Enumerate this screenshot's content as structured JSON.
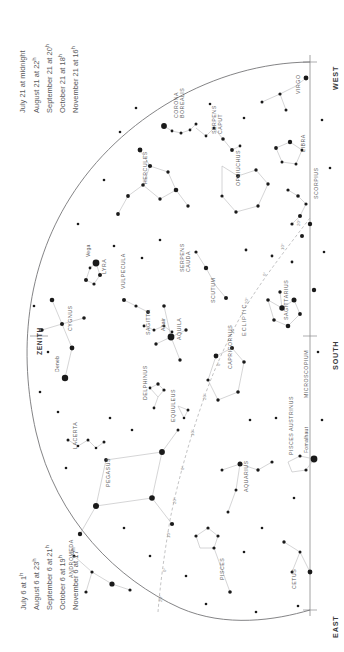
{
  "chart_data": {
    "type": "scatter",
    "xlabel": "",
    "ylabel": "",
    "grid": false,
    "legend_position": "left",
    "projection": "horizon arc with meridian line",
    "axis_note": "Vertical line at right is the horizon/meridian axis marked WEST (top), SOUTH (middle), EAST (bottom)",
    "cardinals": [
      "WEST",
      "SOUTH",
      "EAST"
    ],
    "zenith_label": "ZENITH",
    "ecliptic_label": "ECLIPTIC",
    "ecliptic_ticks": [
      "20°",
      "10°",
      "0°",
      "20°",
      "10°",
      "0°",
      "20°",
      "10°",
      "0°",
      "20°",
      "10°",
      "0°",
      "20°",
      "10°",
      "0°",
      "20°",
      "10°"
    ],
    "named_stars": [
      {
        "name": "Vega",
        "x": 96,
        "y": 263,
        "mag": 0.0
      },
      {
        "name": "Deneb",
        "x": 65,
        "y": 378,
        "mag": 1.3
      },
      {
        "name": "Altair",
        "x": 171,
        "y": 337,
        "mag": 0.8
      },
      {
        "name": "Fomalhaut",
        "x": 314,
        "y": 459,
        "mag": 1.2
      }
    ],
    "constellations": [
      {
        "name": "CORONA BOREALIS",
        "x": 178,
        "y": 118,
        "rot": -90,
        "two_line": true
      },
      {
        "name": "SERPENS CAPUT",
        "x": 216,
        "y": 134,
        "rot": -90,
        "two_line": true
      },
      {
        "name": "HERCULES",
        "x": 147,
        "y": 184,
        "rot": -90
      },
      {
        "name": "OPHIUCHUS",
        "x": 240,
        "y": 186,
        "rot": -90
      },
      {
        "name": "VIRGO",
        "x": 300,
        "y": 94,
        "rot": -90
      },
      {
        "name": "LIBRA",
        "x": 305,
        "y": 152,
        "rot": -90
      },
      {
        "name": "SCORPIUS",
        "x": 318,
        "y": 199,
        "rot": -90
      },
      {
        "name": "LYRA",
        "x": 106,
        "y": 274,
        "rot": -90
      },
      {
        "name": "VULPECULA",
        "x": 125,
        "y": 289,
        "rot": -90
      },
      {
        "name": "SERPENS CAUDA",
        "x": 184,
        "y": 272,
        "rot": -90,
        "two_line": true
      },
      {
        "name": "CYGNUS",
        "x": 72,
        "y": 331,
        "rot": -90
      },
      {
        "name": "SAGITTA",
        "x": 150,
        "y": 335,
        "rot": -90
      },
      {
        "name": "AQUILA",
        "x": 181,
        "y": 340,
        "rot": -90
      },
      {
        "name": "SCUTUM",
        "x": 215,
        "y": 303,
        "rot": -90
      },
      {
        "name": "SAGITTARIUS",
        "x": 288,
        "y": 320,
        "rot": -90
      },
      {
        "name": "DELPHINUS",
        "x": 147,
        "y": 400,
        "rot": -90
      },
      {
        "name": "EQUULEUS",
        "x": 175,
        "y": 422,
        "rot": -90
      },
      {
        "name": "CAPRICORNUS",
        "x": 232,
        "y": 369,
        "rot": -90
      },
      {
        "name": "MICROSCOPIUM",
        "x": 308,
        "y": 398,
        "rot": -90
      },
      {
        "name": "LACERTA",
        "x": 77,
        "y": 449,
        "rot": -90
      },
      {
        "name": "PEGASUS",
        "x": 110,
        "y": 487,
        "rot": -90
      },
      {
        "name": "AQUARIUS",
        "x": 248,
        "y": 492,
        "rot": -90
      },
      {
        "name": "PISCES AUSTRINUS",
        "x": 293,
        "y": 455,
        "rot": -90
      },
      {
        "name": "ANDROMEDA",
        "x": 73,
        "y": 578,
        "rot": -90
      },
      {
        "name": "PISCES",
        "x": 224,
        "y": 580,
        "rot": -90
      },
      {
        "name": "CETUS",
        "x": 296,
        "y": 589,
        "rot": -90
      }
    ]
  },
  "legend_top": {
    "lines": [
      {
        "text": "July 21 at midnight",
        "hour": ""
      },
      {
        "text": "August 21 at",
        "hour": "22"
      },
      {
        "text": "September 21 at",
        "hour": "20"
      },
      {
        "text": "October 21 at",
        "hour": "18"
      },
      {
        "text": "November 21 at",
        "hour": "16"
      }
    ]
  },
  "legend_bottom": {
    "lines": [
      {
        "text": "July 6 at",
        "hour": "1"
      },
      {
        "text": "August 6 at",
        "hour": "23"
      },
      {
        "text": "September 6 at",
        "hour": "21"
      },
      {
        "text": "October 6 at",
        "hour": "19"
      },
      {
        "text": "November 6 at",
        "hour": "17"
      }
    ]
  },
  "cardinals": {
    "west": "WEST",
    "south": "SOUTH",
    "east": "EAST"
  },
  "zenith": {
    "label": "ZENITH"
  },
  "colors": {
    "background": "#ffffff",
    "star": "#1a1a1a",
    "line": "#b9b9bb",
    "horizon": "#6e6e70",
    "text": "#58585a",
    "cardinal_text": "#3a3a3c"
  }
}
